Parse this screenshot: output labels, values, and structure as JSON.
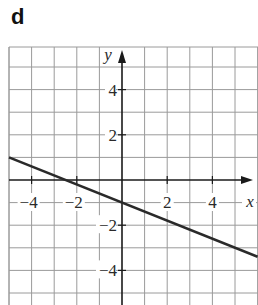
{
  "part_label": "d",
  "chart_data": {
    "type": "line",
    "title": "",
    "xlabel": "x",
    "ylabel": "y",
    "xlim": [
      -5,
      6
    ],
    "ylim": [
      -5.6,
      5.9
    ],
    "grid": true,
    "grid_step": 1,
    "x_ticks": [
      -4,
      -2,
      2,
      4
    ],
    "y_ticks": [
      4,
      2,
      -2,
      -4
    ],
    "x_tick_labels": [
      "−4",
      "−2",
      "2",
      "4"
    ],
    "y_tick_labels": [
      "4",
      "2",
      "−2",
      "−4"
    ],
    "series": [
      {
        "name": "line",
        "equation": "y = -0.4x - 1",
        "slope": -0.4,
        "intercept": -1,
        "x": [
          -5,
          6
        ],
        "y": [
          1,
          -3.4
        ]
      }
    ],
    "points": {
      "y_intercept": [
        0,
        -1
      ],
      "x_intercept": [
        -2.5,
        0
      ]
    },
    "legend": null
  },
  "colors": {
    "grid": "#9a9a9a",
    "axis": "#1a1a1a",
    "line": "#2a2a2a",
    "background": "#ffffff"
  }
}
